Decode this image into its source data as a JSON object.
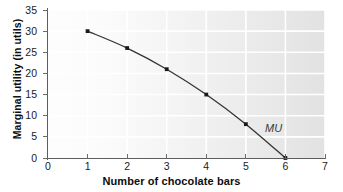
{
  "chart_data": {
    "type": "line",
    "title": "",
    "xlabel": "Number of chocolate bars",
    "ylabel": "Marginal utility (in utils)",
    "x": [
      1,
      2,
      3,
      4,
      5,
      6
    ],
    "values": [
      30,
      26,
      21,
      15,
      8,
      0
    ],
    "series": [
      {
        "name": "MU",
        "x": [
          1,
          2,
          3,
          4,
          5,
          6
        ],
        "values": [
          30,
          26,
          21,
          15,
          8,
          0
        ]
      }
    ],
    "xlim": [
      0,
      7
    ],
    "ylim": [
      0,
      35
    ],
    "xticks": [
      0,
      1,
      2,
      3,
      4,
      5,
      6,
      7
    ],
    "yticks": [
      0,
      5,
      10,
      15,
      20,
      25,
      30,
      35
    ],
    "xticklabels": [
      "0",
      "1",
      "2",
      "3",
      "4",
      "5",
      "6",
      "7"
    ],
    "yticklabels": [
      "0",
      "5",
      "10",
      "15",
      "20",
      "25",
      "30",
      "35"
    ],
    "grid": true,
    "grid_color": "#ffffff",
    "legend": false,
    "annotations": [
      {
        "text": "MU",
        "x": 5.6,
        "y": 4,
        "style": "italic"
      }
    ],
    "marker": "square",
    "marker_color": "#1a1a1a",
    "line_color": "#333333",
    "plot_background": "#f2f2f2",
    "axis_color": "#5d5d5d"
  }
}
